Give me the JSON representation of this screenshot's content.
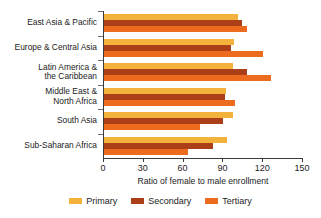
{
  "chart_data": {
    "type": "bar",
    "orientation": "horizontal",
    "title": "",
    "xlabel": "Ratio of female to male enrollment",
    "ylabel": "",
    "xlim": [
      0,
      150
    ],
    "xticks": [
      0,
      30,
      60,
      90,
      120,
      150
    ],
    "xtick_labels": [
      "0",
      "30",
      "60",
      "90",
      "120",
      "150"
    ],
    "grid": false,
    "legend_position": "bottom",
    "categories": [
      "East Asia & Pacific",
      "Europe & Central Asia",
      "Latin America &\nthe Caribbean",
      "Middle East &\nNorth Africa",
      "South Asia",
      "Sub-Saharan Africa"
    ],
    "series": [
      {
        "name": "Primary",
        "color": "#f2b23c",
        "values": [
          101,
          98,
          97,
          92,
          97,
          93
        ]
      },
      {
        "name": "Secondary",
        "color": "#ab3f18",
        "values": [
          104,
          96,
          108,
          91,
          90,
          82
        ]
      },
      {
        "name": "Tertiary",
        "color": "#ed6b1f",
        "values": [
          108,
          120,
          126,
          99,
          72,
          63
        ]
      }
    ]
  },
  "legend": {
    "items": [
      {
        "label": "Primary",
        "swatch": "primary"
      },
      {
        "label": "Secondary",
        "swatch": "secondary"
      },
      {
        "label": "Tertiary",
        "swatch": "tertiary"
      }
    ]
  },
  "colors": {
    "primary": "#f2b23c",
    "secondary": "#ab3f18",
    "tertiary": "#ed6b1f",
    "axis": "#3b3b3b",
    "text": "#1b1b1b",
    "background": "#ffffff"
  }
}
